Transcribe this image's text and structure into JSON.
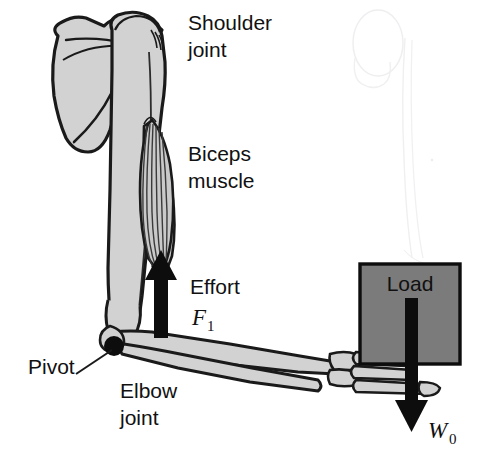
{
  "figure": {
    "background_color": "#ffffff",
    "width": 486,
    "height": 466
  },
  "colors": {
    "bone_fill": "#d2d2d2",
    "bone_outline": "#1a1a1a",
    "muscle_fill": "#c9c9c9",
    "muscle_outline": "#1a1a1a",
    "load_fill": "#7b7b7b",
    "load_outline": "#0d0d0d",
    "arrow_fill": "#0d0d0d",
    "pivot_fill": "#0d0d0d",
    "text_color": "#111111",
    "ghost_sketch": "#e4e2e6"
  },
  "labels": {
    "shoulder_joint_line1": "Shoulder",
    "shoulder_joint_line2": "joint",
    "biceps_line1": "Biceps",
    "biceps_line2": "muscle",
    "effort": "Effort",
    "effort_symbol": "F",
    "effort_subscript": "1",
    "pivot": "Pivot",
    "elbow_line1": "Elbow",
    "elbow_line2": "joint",
    "load": "Load",
    "weight_symbol": "W",
    "weight_subscript": "0"
  },
  "annotations": {
    "effort_arrow_direction": "up",
    "weight_arrow_direction": "down",
    "pivot_leader_line": true,
    "ghost_sketch_visible": true
  }
}
